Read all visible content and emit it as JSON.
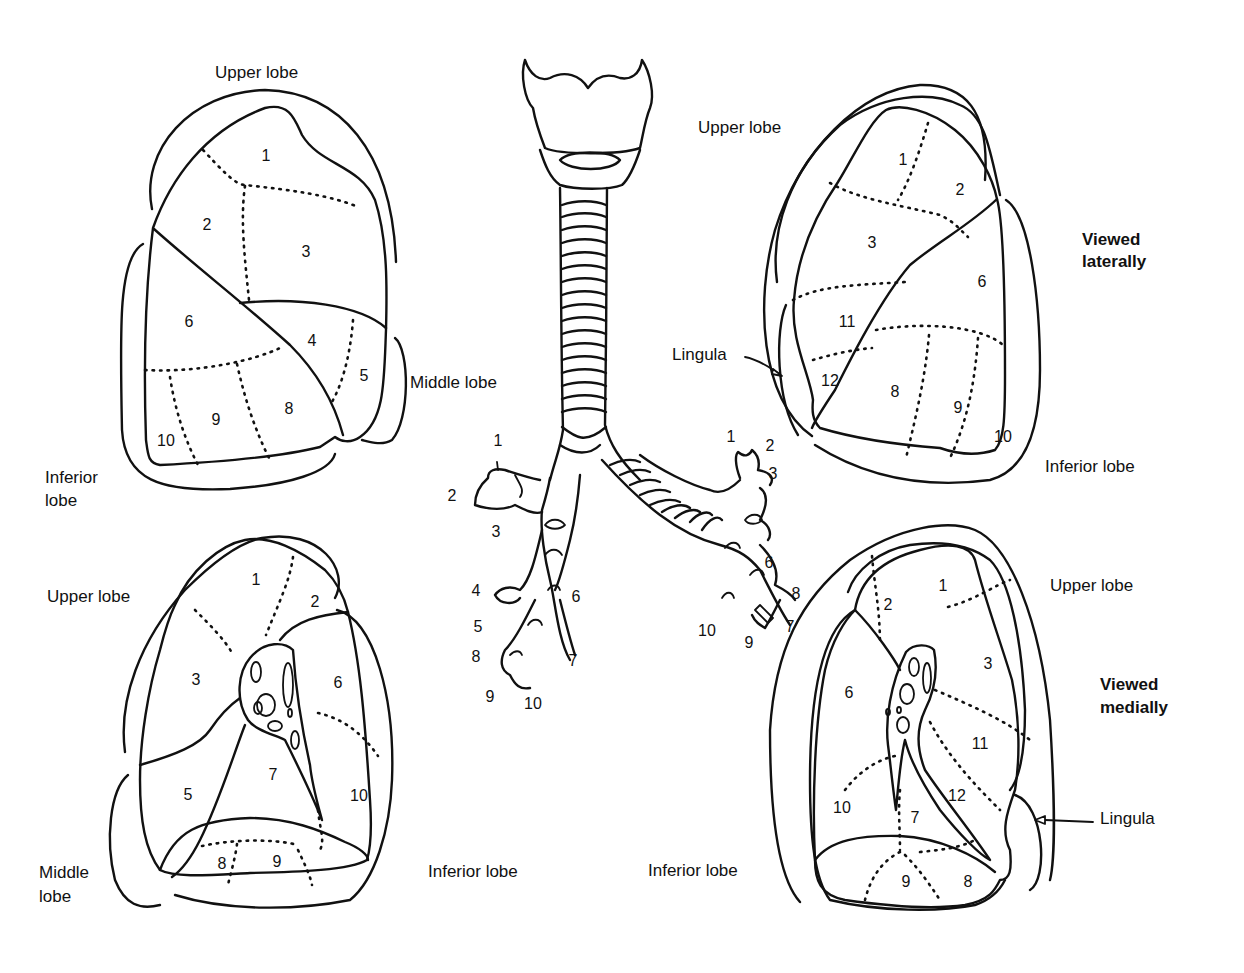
{
  "diagram": {
    "views": [
      {
        "id": "right-lung-lateral",
        "lobe_labels": {
          "upper": "Upper lobe",
          "middle": "Middle lobe",
          "inferior": "Inferior lobe"
        },
        "segments": [
          "1",
          "2",
          "3",
          "4",
          "5",
          "6",
          "8",
          "9",
          "10"
        ]
      },
      {
        "id": "left-lung-lateral",
        "view_label": "Viewed laterally",
        "lobe_labels": {
          "upper": "Upper lobe",
          "lingula": "Lingula",
          "inferior": "Inferior lobe"
        },
        "segments": [
          "1",
          "2",
          "3",
          "6",
          "11",
          "12",
          "8",
          "9",
          "10"
        ]
      },
      {
        "id": "right-lung-medial",
        "lobe_labels": {
          "upper": "Upper lobe",
          "middle": "Middle lobe",
          "inferior": "Inferior lobe"
        },
        "segments": [
          "1",
          "2",
          "3",
          "6",
          "5",
          "7",
          "10",
          "8",
          "9"
        ]
      },
      {
        "id": "left-lung-medial",
        "view_label": "Viewed medially",
        "lobe_labels": {
          "upper": "Upper lobe",
          "lingula": "Lingula",
          "inferior": "Inferior lobe"
        },
        "segments": [
          "2",
          "1",
          "3",
          "6",
          "11",
          "12",
          "10",
          "7",
          "9",
          "8"
        ]
      }
    ],
    "bronchial_tree": {
      "right_bronchus_segments": [
        "1",
        "2",
        "3",
        "4",
        "5",
        "6",
        "7",
        "8",
        "9",
        "10"
      ],
      "left_bronchus_segments": [
        "1",
        "2",
        "3",
        "6",
        "8",
        "7",
        "10",
        "9"
      ]
    }
  },
  "labels": {
    "tl_upper": "Upper lobe",
    "tl_middle": "Middle lobe",
    "tl_inferior_1": "Inferior",
    "tl_inferior_2": "lobe",
    "tr_upper": "Upper lobe",
    "tr_view_1": "Viewed",
    "tr_view_2": "laterally",
    "tr_lingula": "Lingula",
    "tr_inferior": "Inferior lobe",
    "bl_upper": "Upper lobe",
    "bl_middle_1": "Middle",
    "bl_middle_2": "lobe",
    "bl_inferior": "Inferior lobe",
    "br_upper": "Upper lobe",
    "br_view_1": "Viewed",
    "br_view_2": "medially",
    "br_lingula": "Lingula",
    "br_inferior": "Inferior lobe"
  },
  "nums": {
    "tl": {
      "s1": "1",
      "s2": "2",
      "s3": "3",
      "s4": "4",
      "s5": "5",
      "s6": "6",
      "s8": "8",
      "s9": "9",
      "s10": "10"
    },
    "tr": {
      "s1": "1",
      "s2": "2",
      "s3": "3",
      "s6": "6",
      "s11": "11",
      "s12": "12",
      "s8": "8",
      "s9": "9",
      "s10": "10"
    },
    "bl": {
      "s1": "1",
      "s2": "2",
      "s3": "3",
      "s5": "5",
      "s6": "6",
      "s7": "7",
      "s8": "8",
      "s9": "9",
      "s10": "10"
    },
    "br": {
      "s1": "1",
      "s2": "2",
      "s3": "3",
      "s6": "6",
      "s7": "7",
      "s8": "8",
      "s9": "9",
      "s10": "10",
      "s11": "11",
      "s12": "12"
    },
    "rb": {
      "s1": "1",
      "s2": "2",
      "s3": "3",
      "s4": "4",
      "s5": "5",
      "s6": "6",
      "s7": "7",
      "s8": "8",
      "s9": "9",
      "s10": "10"
    },
    "lb": {
      "s1": "1",
      "s2": "2",
      "s3": "3",
      "s6": "6",
      "s7": "7",
      "s8": "8",
      "s9": "9",
      "s10": "10"
    }
  }
}
